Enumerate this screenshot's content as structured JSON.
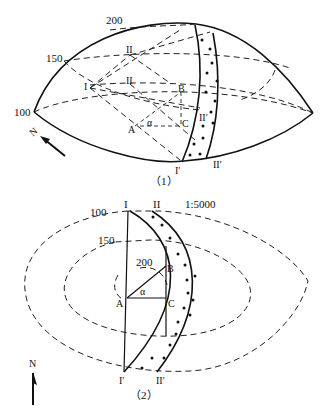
{
  "figure1": {
    "caption": "（1）",
    "contour_labels": [
      "200",
      "150",
      "100"
    ],
    "points": {
      "I": "I",
      "II": "II",
      "A": "A",
      "B": "B",
      "C": "C",
      "I_prime": "I′",
      "II_prime": "II′",
      "II_mid": "II",
      "I_left": "I",
      "II_inner": "II′"
    },
    "angle": "α",
    "north": "N"
  },
  "figure2": {
    "caption": "（2）",
    "scale": "1:5000",
    "contour_labels": [
      "100",
      "150",
      "200"
    ],
    "points": {
      "I": "I",
      "II": "II",
      "A": "A",
      "B": "B",
      "C": "C",
      "I_prime": "I′",
      "II_prime": "II′"
    },
    "angle": "α",
    "north": "N"
  }
}
